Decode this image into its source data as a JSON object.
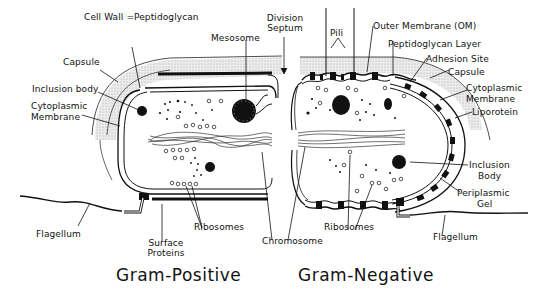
{
  "diagram": {
    "left_cell": {
      "title": "Gram-Positive",
      "labels": {
        "cell_wall": "Cell Wall =Peptidoglycan",
        "capsule": "Capsule",
        "inclusion_body": "Inclusion body",
        "cytoplasmic_membrane_1": "Cytoplasmic",
        "cytoplasmic_membrane_2": "Membrane",
        "mesosome": "Mesosome",
        "flagellum": "Flagellum",
        "surface_proteins_1": "Surface",
        "surface_proteins_2": "Proteins",
        "ribosomes": "Ribosomes"
      }
    },
    "center": {
      "division_septum_1": "Division",
      "division_septum_2": "Septum",
      "chromosome": "Chromosome"
    },
    "right_cell": {
      "title": "Gram-Negative",
      "labels": {
        "pili": "Pili",
        "outer_membrane": "Outer Membrane (OM)",
        "peptidoglycan_layer": "Peptidoglycan Layer",
        "adhesion_site": "Adhesion Site",
        "capsule": "Capsule",
        "cytoplasmic_membrane_1": "Cytoplasmic",
        "cytoplasmic_membrane_2": "Membrane",
        "liporotein": "Liporotein",
        "inclusion_body_1": "Inclusion",
        "inclusion_body_2": "Body",
        "periplasmic_gel_1": "Periplasmic",
        "periplasmic_gel_2": "Gel",
        "ribosomes": "Ribosomes",
        "flagellum": "Flagellum"
      }
    }
  }
}
